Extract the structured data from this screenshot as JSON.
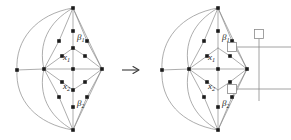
{
  "figure": {
    "type": "graph-transformation-diagram",
    "arrow": {
      "glyph": "→",
      "name": "rightwards-arrow",
      "x": 129,
      "y": 70
    },
    "colors": {
      "edge": "#8a8a8a",
      "vertex": "#1c1c1c",
      "label": "#1c1c1c",
      "overlay": "#8a8a8a",
      "background": "#ffffff"
    },
    "left_graph": {
      "name": "source-graph",
      "origin_x": 0,
      "labels": [
        {
          "id": "beta1",
          "base": "β",
          "sub": "1",
          "x": 79,
          "y": 37
        },
        {
          "id": "x1",
          "base": "x",
          "sub": "1",
          "x": 65,
          "y": 57
        },
        {
          "id": "x2",
          "base": "x",
          "sub": "2",
          "x": 65,
          "y": 86
        },
        {
          "id": "beta2",
          "base": "β",
          "sub": "2",
          "x": 79,
          "y": 103
        }
      ],
      "vertices": [
        {
          "name": "apex-top",
          "x": 73,
          "y": 8
        },
        {
          "name": "apex-bottom",
          "x": 73,
          "y": 130
        },
        {
          "name": "hub-left",
          "x": 44,
          "y": 69
        },
        {
          "name": "hub-center",
          "x": 73,
          "y": 69
        },
        {
          "name": "hub-right",
          "x": 102,
          "y": 69
        },
        {
          "name": "outer-left",
          "x": 17,
          "y": 70
        },
        {
          "name": "upper-left-mid",
          "x": 59,
          "y": 41
        },
        {
          "name": "upper-right-mid",
          "x": 87,
          "y": 41
        },
        {
          "name": "upper-stem",
          "x": 73,
          "y": 31
        },
        {
          "name": "upper-inner-l",
          "x": 62,
          "y": 56
        },
        {
          "name": "upper-inner-r",
          "x": 85,
          "y": 56
        },
        {
          "name": "lower-inner-l",
          "x": 62,
          "y": 82
        },
        {
          "name": "lower-inner-r",
          "x": 85,
          "y": 82
        },
        {
          "name": "lower-left-mid",
          "x": 59,
          "y": 97
        },
        {
          "name": "lower-right-mid",
          "x": 87,
          "y": 97
        },
        {
          "name": "lower-stem",
          "x": 73,
          "y": 107
        }
      ]
    },
    "right_graph": {
      "name": "result-graph",
      "origin_x": 145,
      "labels": [
        {
          "id": "beta1",
          "base": "β",
          "sub": "1",
          "x": 224,
          "y": 37
        },
        {
          "id": "x1",
          "base": "x",
          "sub": "1",
          "x": 210,
          "y": 57
        },
        {
          "id": "x2",
          "base": "x",
          "sub": "2",
          "x": 210,
          "y": 86
        },
        {
          "id": "beta2",
          "base": "β",
          "sub": "2",
          "x": 224,
          "y": 103
        }
      ],
      "squares": [
        {
          "name": "square-marker-upper",
          "x": 232,
          "y": 45,
          "size": 9
        },
        {
          "name": "square-marker-lower",
          "x": 232,
          "y": 89,
          "size": 9
        },
        {
          "name": "square-marker-root",
          "x": 259,
          "y": 34,
          "size": 9
        }
      ],
      "overlay": {
        "name": "dual-tree-overlay",
        "vertical_line": {
          "x": 259,
          "y1": 39,
          "y2": 101
        },
        "horizontal_lines": [
          {
            "y": 47,
            "x1": 236,
            "x2": 291
          },
          {
            "y": 89,
            "x1": 236,
            "x2": 291
          }
        ]
      }
    }
  }
}
